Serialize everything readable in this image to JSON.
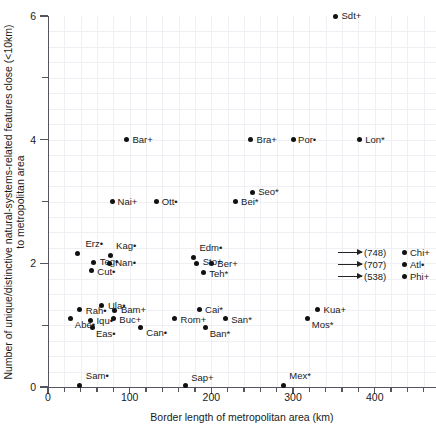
{
  "chart_data": {
    "type": "scatter",
    "title": "",
    "xlabel": "Border length of metropolitan area (km)",
    "ylabel": "Number of unique/distinctive natural-systems-related features close (<10km) to metropolitan area",
    "xlim": [
      0,
      475
    ],
    "ylim": [
      0,
      6
    ],
    "xticks": [
      0,
      100,
      200,
      300,
      400
    ],
    "xticklabels": [
      "0",
      "100",
      "200",
      "300",
      "400"
    ],
    "yticks": [
      0,
      1,
      2,
      3,
      4,
      5,
      6
    ],
    "yticklabels": [
      "0",
      "",
      "2",
      "",
      "4",
      "",
      "6"
    ],
    "grid": "faint",
    "legend_position": "right-middle",
    "points": [
      {
        "label": "Sdt+",
        "x": 352,
        "y": 6.0,
        "lx": 6,
        "ly": -5
      },
      {
        "label": "Bar+",
        "x": 96,
        "y": 4.0,
        "lx": 6,
        "ly": -5
      },
      {
        "label": "Bra+",
        "x": 248,
        "y": 4.0,
        "lx": 6,
        "ly": -5
      },
      {
        "label": "Por•",
        "x": 300,
        "y": 4.0,
        "lx": 5,
        "ly": -5
      },
      {
        "label": "Lon*",
        "x": 381,
        "y": 4.0,
        "lx": 6,
        "ly": -5
      },
      {
        "label": "Seo*",
        "x": 250,
        "y": 3.15,
        "lx": 6,
        "ly": -5
      },
      {
        "label": "Bei*",
        "x": 229,
        "y": 3.0,
        "lx": 6,
        "ly": -5
      },
      {
        "label": "Nai+",
        "x": 79,
        "y": 3.0,
        "lx": 5,
        "ly": -5
      },
      {
        "label": "Ott•",
        "x": 133,
        "y": 3.0,
        "lx": 5,
        "ly": -5
      },
      {
        "label": "Erz•",
        "x": 36,
        "y": 2.16,
        "lx": 8,
        "ly": -14
      },
      {
        "label": "Kag•",
        "x": 76,
        "y": 2.13,
        "lx": 6,
        "ly": -14
      },
      {
        "label": "Teg•",
        "x": 56,
        "y": 2.02,
        "lx": 6,
        "ly": -5
      },
      {
        "label": "Nan•",
        "x": 75,
        "y": 2.0,
        "lx": 6,
        "ly": -5
      },
      {
        "label": "Cut•",
        "x": 53,
        "y": 1.88,
        "lx": 6,
        "ly": -4
      },
      {
        "label": "Edm•",
        "x": 178,
        "y": 2.1,
        "lx": 6,
        "ly": -14
      },
      {
        "label": "Sto+",
        "x": 182,
        "y": 2.0,
        "lx": 6,
        "ly": -6
      },
      {
        "label": "Ber+",
        "x": 200,
        "y": 1.99,
        "lx": 6,
        "ly": -5
      },
      {
        "label": "Teh*",
        "x": 190,
        "y": 1.85,
        "lx": 6,
        "ly": -4
      },
      {
        "label": "Ula•",
        "x": 66,
        "y": 1.31,
        "lx": 6,
        "ly": -5
      },
      {
        "label": "Rah•",
        "x": 39,
        "y": 1.25,
        "lx": 6,
        "ly": -4
      },
      {
        "label": "Bam+",
        "x": 82,
        "y": 1.24,
        "lx": 6,
        "ly": -5
      },
      {
        "label": "Cai*",
        "x": 185,
        "y": 1.25,
        "lx": 6,
        "ly": -5
      },
      {
        "label": "Kua+",
        "x": 330,
        "y": 1.25,
        "lx": 6,
        "ly": -5
      },
      {
        "label": "Abe•",
        "x": 28,
        "y": 1.1,
        "lx": 4,
        "ly": 1
      },
      {
        "label": "Iqu•",
        "x": 52,
        "y": 1.08,
        "lx": 6,
        "ly": -4
      },
      {
        "label": "Buc+",
        "x": 80,
        "y": 1.1,
        "lx": 6,
        "ly": -4
      },
      {
        "label": "Rom+",
        "x": 155,
        "y": 1.1,
        "lx": 6,
        "ly": -4
      },
      {
        "label": "San*",
        "x": 217,
        "y": 1.1,
        "lx": 6,
        "ly": -4
      },
      {
        "label": "Mos*",
        "x": 318,
        "y": 1.1,
        "lx": 4,
        "ly": 1
      },
      {
        "label": "Eas•",
        "x": 55,
        "y": 0.97,
        "lx": 3,
        "ly": 2
      },
      {
        "label": "Can•",
        "x": 113,
        "y": 0.97,
        "lx": 6,
        "ly": 1
      },
      {
        "label": "Ban*",
        "x": 193,
        "y": 0.97,
        "lx": 4,
        "ly": 2
      },
      {
        "label": "Sam•",
        "x": 39,
        "y": 0.03,
        "lx": 6,
        "ly": -14
      },
      {
        "label": "Sap+",
        "x": 168,
        "y": 0.03,
        "lx": 6,
        "ly": -12
      },
      {
        "label": "Mex*",
        "x": 288,
        "y": 0.03,
        "lx": 6,
        "ly": -14
      }
    ],
    "legend": {
      "entries": [
        {
          "value": "(748)",
          "name": "Chi+"
        },
        {
          "value": "(707)",
          "name": "Atl•"
        },
        {
          "value": "(538)",
          "name": "Phi+"
        }
      ]
    }
  }
}
